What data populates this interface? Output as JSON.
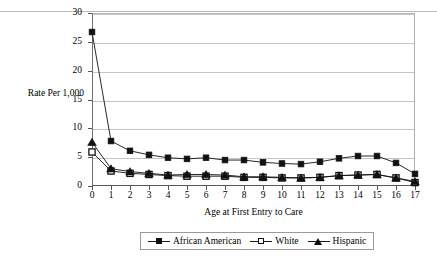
{
  "chart_data": {
    "type": "line",
    "title": "",
    "xlabel": "Age at First Entry to Care",
    "ylabel": "Rate Per 1,000",
    "x": [
      0,
      1,
      2,
      3,
      4,
      5,
      6,
      7,
      8,
      9,
      10,
      11,
      12,
      13,
      14,
      15,
      16,
      17
    ],
    "xticklabels": [
      "0",
      "1",
      "2",
      "3",
      "4",
      "5",
      "6",
      "7",
      "8",
      "9",
      "10",
      "11",
      "12",
      "13",
      "14",
      "15",
      "16",
      "17"
    ],
    "yticklabels": [
      "0",
      "5",
      "10",
      "15",
      "20",
      "25",
      "30"
    ],
    "yticks": [
      0,
      5,
      10,
      15,
      20,
      25,
      30
    ],
    "xlim": [
      0,
      17
    ],
    "ylim": [
      0,
      30
    ],
    "grid": "horizontal",
    "legend_position": "bottom",
    "series": [
      {
        "name": "African American",
        "marker": "filled-square",
        "color": "#111111",
        "values": [
          26.7,
          7.8,
          6.1,
          5.4,
          4.9,
          4.7,
          4.9,
          4.5,
          4.5,
          4.1,
          3.9,
          3.8,
          4.2,
          4.8,
          5.2,
          5.2,
          4.0,
          2.1
        ]
      },
      {
        "name": "White",
        "marker": "open-square",
        "color": "#111111",
        "values": [
          5.9,
          2.6,
          2.2,
          2.0,
          1.8,
          1.7,
          1.7,
          1.7,
          1.5,
          1.5,
          1.4,
          1.4,
          1.5,
          1.8,
          1.9,
          2.0,
          1.4,
          0.6
        ]
      },
      {
        "name": "Hispanic",
        "marker": "filled-triangle",
        "color": "#111111",
        "values": [
          7.6,
          3.0,
          2.5,
          2.2,
          1.9,
          2.0,
          2.0,
          1.9,
          1.6,
          1.6,
          1.5,
          1.4,
          1.5,
          1.8,
          1.9,
          2.0,
          1.4,
          0.8
        ]
      }
    ]
  },
  "legend": {
    "entries": [
      {
        "label": "African American"
      },
      {
        "label": "White"
      },
      {
        "label": "Hispanic"
      }
    ]
  }
}
